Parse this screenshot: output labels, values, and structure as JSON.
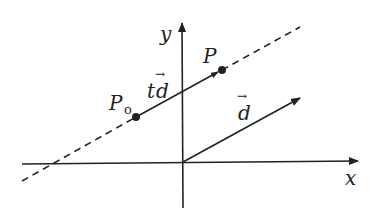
{
  "diagram": {
    "title": "",
    "labels": {
      "y_axis": "y",
      "x_axis": "x",
      "p0_main": "P",
      "p0_sub": "o",
      "p": "P",
      "td_t": "t",
      "td_d": "d",
      "d": "d",
      "vector_arrow": "→"
    },
    "colors": {
      "ink": "#222222",
      "background": "#ffffff"
    }
  }
}
